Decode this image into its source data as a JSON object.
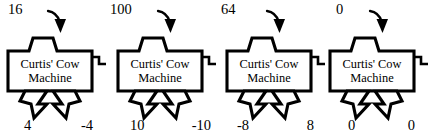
{
  "figure": {
    "machine_label_line1": "Curtis' Cow",
    "machine_label_line2": "Machine",
    "ink_color": "#000000",
    "background_color": "#ffffff",
    "panel_count": 4
  },
  "panels": [
    {
      "id": "panel-1",
      "input": "16",
      "output_left": "4",
      "output_right": "-4",
      "label_line1": "Curtis' Cow",
      "label_line2": "Machine"
    },
    {
      "id": "panel-2",
      "input": "100",
      "output_left": "10",
      "output_right": "-10",
      "label_line1": "Curtis' Cow",
      "label_line2": "Machine"
    },
    {
      "id": "panel-3",
      "input": "64",
      "output_left": "-8",
      "output_right": "8",
      "label_line1": "Curtis' Cow",
      "label_line2": "Machine"
    },
    {
      "id": "panel-4",
      "input": "0",
      "output_left": "0",
      "output_right": "0",
      "label_line1": "Curtis' Cow",
      "label_line2": "Machine"
    }
  ],
  "icons": {
    "input_arrow": "curved-down-arrow-icon",
    "output_arrow": "down-arrow-icon",
    "crank": "crank-handle-icon",
    "hopper": "funnel-icon"
  }
}
